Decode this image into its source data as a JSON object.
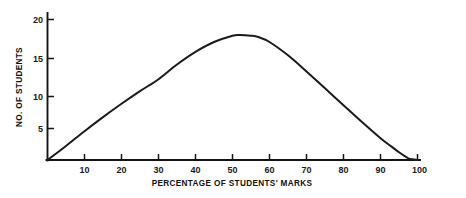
{
  "chart_data": {
    "type": "line",
    "title": "",
    "xlabel": "PERCENTAGE OF STUDENTS' MARKS",
    "ylabel": "NO. OF STUDENTS",
    "xlim": [
      0,
      100
    ],
    "ylim": [
      0,
      21
    ],
    "grid": false,
    "legend": null,
    "xticks": [
      10,
      20,
      30,
      40,
      50,
      60,
      70,
      80,
      90,
      100
    ],
    "xtick_labels": [
      "10",
      "20",
      "30",
      "40",
      "50",
      "60",
      "70",
      "80",
      "90",
      "100"
    ],
    "yticks": [
      5,
      10,
      15,
      20
    ],
    "ytick_labels": [
      "5",
      "10",
      "15",
      "20"
    ],
    "series": [
      {
        "name": "No. of students",
        "x": [
          0,
          5,
          10,
          15,
          20,
          25,
          30,
          35,
          40,
          45,
          50,
          52,
          55,
          57,
          60,
          65,
          70,
          75,
          80,
          85,
          90,
          93,
          95,
          97,
          98,
          100
        ],
        "values": [
          0,
          2.0,
          4.1,
          6.1,
          8.0,
          9.8,
          11.5,
          13.6,
          15.4,
          16.8,
          17.7,
          17.8,
          17.7,
          17.5,
          16.8,
          14.9,
          12.6,
          10.2,
          7.8,
          5.4,
          3.1,
          1.9,
          1.1,
          0.4,
          0.15,
          0.0
        ]
      }
    ],
    "annotations": [],
    "line_color": "#1b1b1b",
    "background_color": "#ffffff",
    "axis_color": "#141414"
  },
  "figure": {
    "y_axis_label": "NO. OF STUDENTS",
    "x_axis_label": "PERCENTAGE OF STUDENTS' MARKS"
  }
}
